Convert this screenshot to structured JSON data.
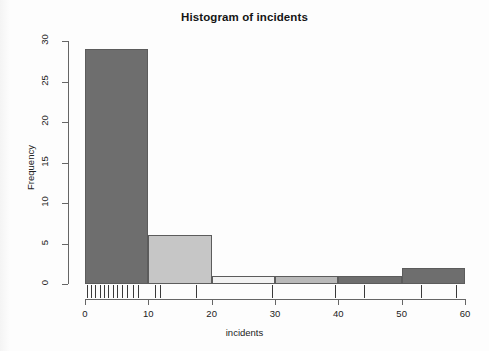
{
  "chart_data": {
    "type": "bar",
    "title": "Histogram of incidents",
    "xlabel": "incidents",
    "ylabel": "Frequency",
    "bin_width": 10,
    "bin_edges": [
      0,
      10,
      20,
      30,
      40,
      50,
      60
    ],
    "categories": [
      "0-10",
      "10-20",
      "20-30",
      "30-40",
      "40-50",
      "50-60"
    ],
    "values": [
      29,
      6,
      1,
      1,
      1,
      2
    ],
    "bar_colors": [
      "#6e6e6e",
      "#c6c6c6",
      "#f2f2f2",
      "#b9b9b9",
      "#6e6e6e",
      "#6e6e6e"
    ],
    "bar_border_color": "#5c5c5c",
    "xlim": [
      0,
      60
    ],
    "ylim": [
      0,
      30
    ],
    "xticks": [
      0,
      10,
      20,
      30,
      40,
      50,
      60
    ],
    "xtick_labels": [
      "0",
      "10",
      "20",
      "30",
      "40",
      "50",
      "60"
    ],
    "yticks": [
      0,
      5,
      10,
      15,
      20,
      25,
      30
    ],
    "ytick_labels": [
      "0",
      "5",
      "10",
      "15",
      "20",
      "25",
      "30"
    ],
    "grid": false,
    "legend": false,
    "rug": {
      "present": true,
      "description": "rug marks of individual incident values below x axis",
      "values": [
        0.3,
        1.0,
        1.6,
        2.3,
        3.0,
        3.7,
        4.4,
        5.1,
        5.8,
        6.6,
        7.5,
        8.4,
        11.0,
        11.8,
        17.6,
        29.5,
        39.5,
        44.0,
        53.0,
        58.5
      ]
    }
  },
  "axes": {
    "y_tick_labels": [
      "0",
      "5",
      "10",
      "15",
      "20",
      "25",
      "30"
    ],
    "x_tick_labels": [
      "0",
      "10",
      "20",
      "30",
      "40",
      "50",
      "60"
    ]
  },
  "labels": {
    "title": "Histogram of incidents",
    "x_title": "incidents",
    "y_title": "Frequency"
  }
}
